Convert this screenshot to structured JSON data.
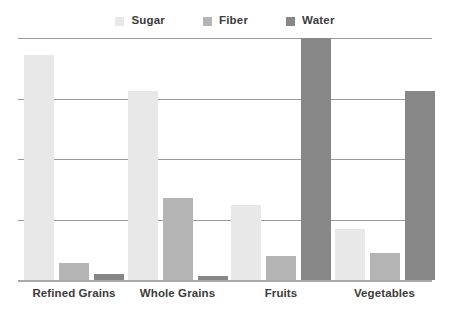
{
  "chart_data": {
    "type": "bar",
    "title": "",
    "subtitle": "",
    "xlabel": "",
    "ylabel": "",
    "categories": [
      "Refined Grains",
      "Whole Grains",
      "Fruits",
      "Vegetables"
    ],
    "series": [
      {
        "name": "Sugar",
        "color": "#e8e8e8",
        "values": [
          93,
          78,
          31,
          21
        ]
      },
      {
        "name": "Fiber",
        "color": "#b4b4b4",
        "values": [
          7,
          34,
          10,
          11
        ]
      },
      {
        "name": "Water",
        "color": "#878787",
        "values": [
          2.5,
          1.5,
          100,
          78
        ]
      }
    ],
    "ylim": [
      0,
      100
    ],
    "yticks": [
      0,
      25,
      50,
      75,
      100
    ],
    "ytick_labels": [],
    "grid": true,
    "grid_axis": "y",
    "grid_color": "#9a9a9a",
    "baseline_color": "#a9a9a9",
    "legend_position": "top",
    "background": "#ffffff",
    "annotations": []
  },
  "legend": {
    "items": [
      {
        "label": "Sugar",
        "swatch_color": "#e8e8e8"
      },
      {
        "label": "Fiber",
        "swatch_color": "#b4b4b4"
      },
      {
        "label": "Water",
        "swatch_color": "#878787"
      }
    ]
  },
  "axis": {
    "categories": [
      "Refined Grains",
      "Whole Grains",
      "Fruits",
      "Vegetables"
    ]
  }
}
